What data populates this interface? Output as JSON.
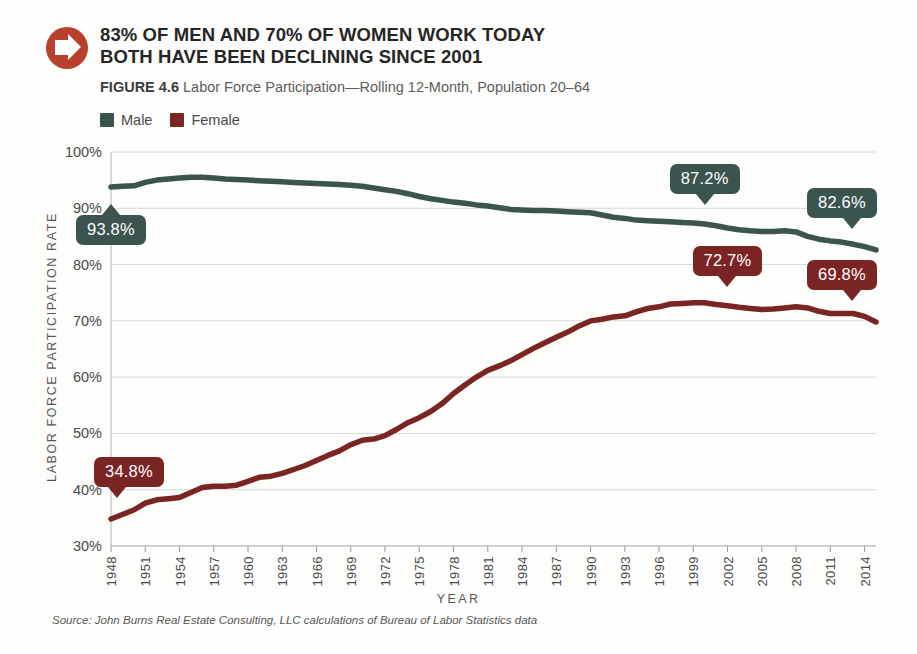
{
  "header": {
    "icon": "arrow-right-circle-icon",
    "title_line1": "83% OF MEN AND 70% OF WOMEN WORK TODAY",
    "title_line2": "BOTH HAVE BEEN DECLINING SINCE 2001",
    "figure_label": "FIGURE 4.6",
    "figure_caption": "Labor Force Participation—Rolling 12-Month, Population 20–64"
  },
  "source": "Source: John Burns Real Estate Consulting, LLC calculations of Bureau of Labor Statistics data",
  "colors": {
    "male": "#3b5450",
    "female": "#7b2424",
    "badge": "#b8402c",
    "grid": "#d8d8d8",
    "text": "#4a4a4a"
  },
  "chart_data": {
    "type": "line",
    "title": "Labor Force Participation—Rolling 12-Month, Population 20–64",
    "xlabel": "YEAR",
    "ylabel": "LABOR FORCE PARTICIPATION RATE",
    "ylim": [
      30,
      100
    ],
    "yticks": [
      "30%",
      "40%",
      "50%",
      "60%",
      "70%",
      "80%",
      "90%",
      "100%"
    ],
    "ytick_values": [
      30,
      40,
      50,
      60,
      70,
      80,
      90,
      100
    ],
    "grid": true,
    "legend_position": "top-left",
    "xlim": [
      1948,
      2015
    ],
    "xticks": [
      1948,
      1951,
      1954,
      1957,
      1960,
      1963,
      1966,
      1969,
      1972,
      1975,
      1978,
      1981,
      1984,
      1987,
      1990,
      1993,
      1996,
      1999,
      2002,
      2005,
      2008,
      2011,
      2014
    ],
    "x": [
      1948,
      1949,
      1950,
      1951,
      1952,
      1953,
      1954,
      1955,
      1956,
      1957,
      1958,
      1959,
      1960,
      1961,
      1962,
      1963,
      1964,
      1965,
      1966,
      1967,
      1968,
      1969,
      1970,
      1971,
      1972,
      1973,
      1974,
      1975,
      1976,
      1977,
      1978,
      1979,
      1980,
      1981,
      1982,
      1983,
      1984,
      1985,
      1986,
      1987,
      1988,
      1989,
      1990,
      1991,
      1992,
      1993,
      1994,
      1995,
      1996,
      1997,
      1998,
      1999,
      2000,
      2001,
      2002,
      2003,
      2004,
      2005,
      2006,
      2007,
      2008,
      2009,
      2010,
      2011,
      2012,
      2013,
      2014,
      2015
    ],
    "series": [
      {
        "name": "Male",
        "color": "#3b5450",
        "values": [
          93.8,
          93.9,
          94.0,
          94.6,
          95.0,
          95.2,
          95.4,
          95.5,
          95.5,
          95.4,
          95.2,
          95.1,
          95.0,
          94.9,
          94.8,
          94.7,
          94.6,
          94.5,
          94.4,
          94.3,
          94.2,
          94.1,
          93.9,
          93.6,
          93.3,
          93.0,
          92.6,
          92.1,
          91.7,
          91.4,
          91.1,
          90.9,
          90.6,
          90.4,
          90.1,
          89.8,
          89.7,
          89.6,
          89.6,
          89.5,
          89.4,
          89.3,
          89.2,
          88.8,
          88.4,
          88.2,
          87.9,
          87.8,
          87.7,
          87.6,
          87.5,
          87.4,
          87.2,
          86.9,
          86.5,
          86.2,
          86.0,
          85.9,
          85.9,
          86.0,
          85.8,
          85.0,
          84.5,
          84.2,
          84.0,
          83.6,
          83.2,
          82.6
        ]
      },
      {
        "name": "Female",
        "color": "#7b2424",
        "values": [
          34.8,
          35.6,
          36.4,
          37.6,
          38.2,
          38.4,
          38.6,
          39.5,
          40.4,
          40.6,
          40.6,
          40.8,
          41.5,
          42.2,
          42.4,
          42.9,
          43.6,
          44.3,
          45.2,
          46.1,
          46.9,
          48.0,
          48.8,
          49.0,
          49.6,
          50.7,
          51.9,
          52.8,
          53.9,
          55.3,
          57.1,
          58.6,
          60.0,
          61.2,
          62.0,
          62.9,
          64.0,
          65.1,
          66.1,
          67.1,
          68.0,
          69.1,
          70.0,
          70.3,
          70.7,
          70.9,
          71.6,
          72.2,
          72.5,
          73.0,
          73.1,
          73.2,
          73.2,
          72.9,
          72.7,
          72.4,
          72.2,
          72.0,
          72.1,
          72.3,
          72.5,
          72.3,
          71.7,
          71.3,
          71.3,
          71.3,
          70.8,
          69.8
        ]
      }
    ],
    "annotations": [
      {
        "label": "93.8%",
        "series": "Male",
        "year": 1948,
        "value": 93.8,
        "tail": "up"
      },
      {
        "label": "87.2%",
        "series": "Male",
        "year": 2000,
        "value": 87.2,
        "tail": "down"
      },
      {
        "label": "82.6%",
        "series": "Male",
        "year": 2015,
        "value": 82.6,
        "tail": "down-right"
      },
      {
        "label": "34.8%",
        "series": "Female",
        "year": 1948,
        "value": 34.8,
        "tail": "down-left"
      },
      {
        "label": "72.7%",
        "series": "Female",
        "year": 2002,
        "value": 72.7,
        "tail": "down"
      },
      {
        "label": "69.8%",
        "series": "Female",
        "year": 2015,
        "value": 69.8,
        "tail": "down-right"
      }
    ]
  }
}
